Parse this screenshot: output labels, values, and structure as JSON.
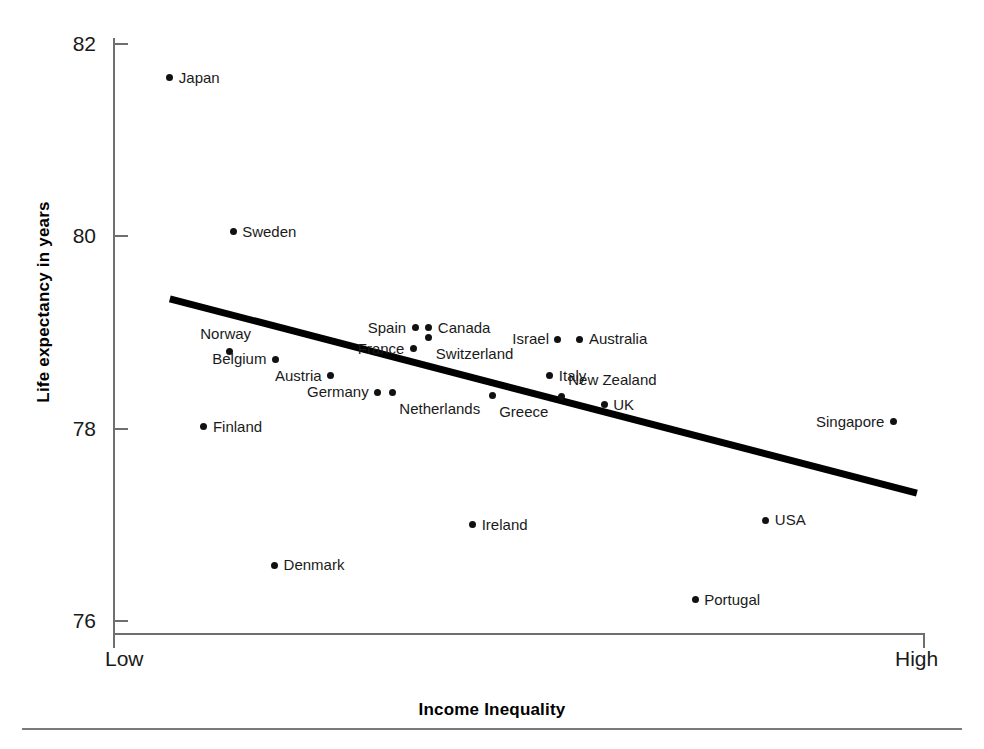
{
  "chart_data": {
    "type": "scatter",
    "title": "",
    "xlabel": "Income Inequality",
    "ylabel": "Life expectancy in years",
    "x_tick_labels": [
      "Low",
      "High"
    ],
    "y_tick_labels": [
      "82",
      "80",
      "78",
      "76"
    ],
    "y_ticks": [
      82,
      80,
      78,
      76
    ],
    "ylim": [
      75.6,
      82.3
    ],
    "xlim": [
      0,
      1
    ],
    "grid": false,
    "legend": null,
    "point_color": "#111111",
    "trendline": {
      "type": "linear-fit",
      "color": "#000000",
      "x_start": 0.07,
      "x_end": 0.99,
      "y_start": 79.35,
      "y_end": 77.33
    },
    "points": [
      {
        "label": "Japan",
        "x": 0.07,
        "y": 81.65,
        "label_side": "right"
      },
      {
        "label": "Sweden",
        "x": 0.148,
        "y": 80.05,
        "label_side": "right"
      },
      {
        "label": "Spain",
        "x": 0.372,
        "y": 79.05,
        "label_side": "left"
      },
      {
        "label": "Canada",
        "x": 0.389,
        "y": 79.05,
        "label_side": "right"
      },
      {
        "label": "Israel",
        "x": 0.548,
        "y": 78.93,
        "label_side": "left"
      },
      {
        "label": "Australia",
        "x": 0.575,
        "y": 78.93,
        "label_side": "right"
      },
      {
        "label": "Norway",
        "x": 0.143,
        "y": 78.8,
        "label_side": "above-left"
      },
      {
        "label": "France",
        "x": 0.37,
        "y": 78.83,
        "label_side": "left"
      },
      {
        "label": "Switzerland",
        "x": 0.389,
        "y": 78.95,
        "label_side": "below-right"
      },
      {
        "label": "Belgium",
        "x": 0.2,
        "y": 78.72,
        "label_side": "left"
      },
      {
        "label": "Italy",
        "x": 0.538,
        "y": 78.55,
        "label_side": "right"
      },
      {
        "label": "Austria",
        "x": 0.268,
        "y": 78.55,
        "label_side": "left"
      },
      {
        "label": "Germany",
        "x": 0.326,
        "y": 78.38,
        "label_side": "left"
      },
      {
        "label": "Netherlands",
        "x": 0.344,
        "y": 78.38,
        "label_side": "below-right"
      },
      {
        "label": "New Zealand",
        "x": 0.552,
        "y": 78.33,
        "label_side": "above-right"
      },
      {
        "label": "Greece",
        "x": 0.467,
        "y": 78.35,
        "label_side": "below-right"
      },
      {
        "label": "UK",
        "x": 0.605,
        "y": 78.25,
        "label_side": "right"
      },
      {
        "label": "Finland",
        "x": 0.112,
        "y": 78.02,
        "label_side": "right"
      },
      {
        "label": "Singapore",
        "x": 0.961,
        "y": 78.07,
        "label_side": "left"
      },
      {
        "label": "Ireland",
        "x": 0.443,
        "y": 77.0,
        "label_side": "right"
      },
      {
        "label": "USA",
        "x": 0.804,
        "y": 77.05,
        "label_side": "right"
      },
      {
        "label": "Denmark",
        "x": 0.199,
        "y": 76.58,
        "label_side": "right"
      },
      {
        "label": "Portugal",
        "x": 0.717,
        "y": 76.22,
        "label_side": "right"
      }
    ]
  },
  "axes": {
    "y_title": "Life expectancy in years",
    "x_title": "Income Inequality",
    "x_low": "Low",
    "x_high": "High",
    "y_labels": [
      "82",
      "80",
      "78",
      "76"
    ]
  }
}
